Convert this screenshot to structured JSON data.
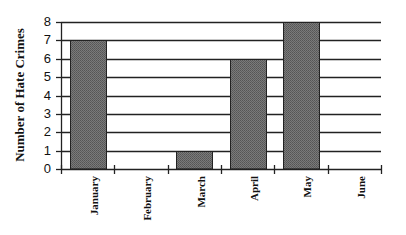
{
  "chart_data": {
    "type": "bar",
    "title": "",
    "xlabel": "",
    "ylabel": "Number of Hate Crimes",
    "categories": [
      "January",
      "February",
      "March",
      "April",
      "May",
      "June"
    ],
    "values": [
      7,
      0,
      1,
      6,
      8,
      0
    ],
    "ylim": [
      0,
      8
    ],
    "yticks": [
      0,
      1,
      2,
      3,
      4,
      5,
      6,
      7,
      8
    ],
    "grid": true,
    "legend": null,
    "bar_color": "#6e6e6e",
    "grid_color": "#222222"
  }
}
